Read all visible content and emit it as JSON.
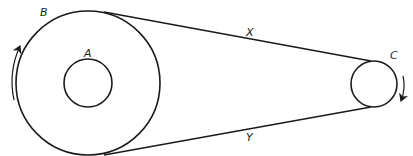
{
  "diagram": {
    "type": "belt-pulley",
    "labels": {
      "large_pulley": "B",
      "hub": "A",
      "small_pulley": "C",
      "top_belt": "X",
      "bottom_belt": "Y"
    },
    "large_pulley": {
      "cx": 88,
      "cy": 83,
      "r": 72
    },
    "hub": {
      "cx": 88,
      "cy": 83,
      "r": 24
    },
    "small_pulley": {
      "cx": 374,
      "cy": 84,
      "r": 23
    },
    "rotation": {
      "large_pulley_arrow": "counterclockwise (up on left side)",
      "small_pulley_arrow": "clockwise (down on right side)"
    },
    "colors": {
      "line": "#1a1a1a",
      "background": "#ffffff"
    }
  }
}
